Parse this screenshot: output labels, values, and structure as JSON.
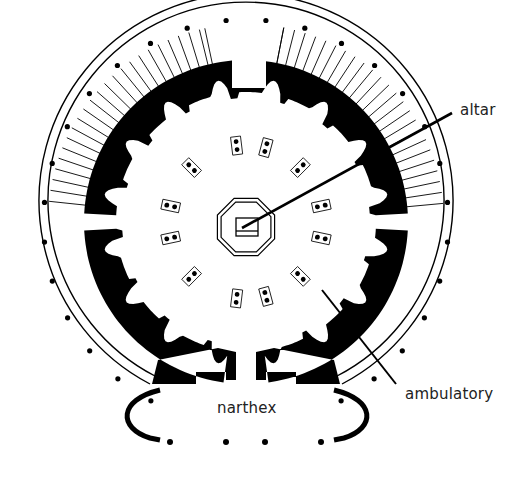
{
  "figure": {
    "type": "architectural floor plan",
    "colors": {
      "background": "#ffffff",
      "ink": "#000000",
      "label_text": "#222222"
    }
  },
  "labels": {
    "altar": "altar",
    "ambulatory": "ambulatory",
    "narthex": "narthex"
  },
  "plan": {
    "center": [
      246,
      222
    ],
    "outer_colonnade_columns": 28,
    "interior_pier_pairs": 12,
    "narthex_columns": 4
  }
}
